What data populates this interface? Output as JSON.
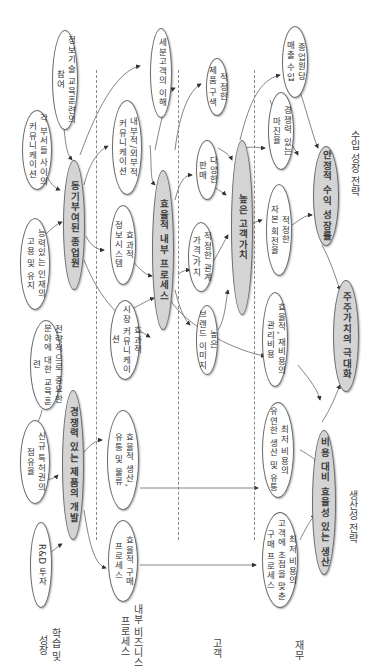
{
  "perspectives": [
    {
      "id": "learning",
      "label": "학습 및\n성장"
    },
    {
      "id": "internal",
      "label": "내부 비즈니스\n프로세스"
    },
    {
      "id": "customer",
      "label": "고객"
    },
    {
      "id": "financial",
      "label": "재무"
    }
  ],
  "strategies": {
    "revenue": "수입 성장 전략",
    "productivity": "생산성 전략"
  },
  "nodes": {
    "it_training": "정보기술 교육훈련의\n참여",
    "dept_comm": "각 부서들 사이의\n커뮤니케이션",
    "retain_talent": "능력있는 인재의\n고용 및 유지",
    "strategic_training": "전략적으로 중요한\n분야에 대한 교육훈련",
    "new_patent": "신규 특허권의\n점유율",
    "rnd": "R&D 투자",
    "motivated_staff": "동기부여된 종업원",
    "competitive_product": "경쟁력 있는 제품의 개발",
    "segment_understanding": "세분고객의 이해",
    "int_ext_comm": "내부적/외부적\n커뮤니케이션",
    "effective_is": "효과적\n정보시스템",
    "market_comm": "효과적\n시장 커뮤니케이션",
    "efficient_internal": "효율적 내부 프로세스",
    "efficient_production": "효율적 생산,\n유통 및 물류",
    "efficient_purchase": "효율적 구매\n프로세스",
    "proper_mix": "적정한\n제품 구색",
    "diverse_sales": "다양한\n판매",
    "price_value": "적정한 관계\n가격/가치",
    "brand_image": "높은\n브랜드 이미지",
    "high_customer_value": "높은 고객가치",
    "revenue_per_employee": "종업원당\n매출 수입",
    "competitive_margin": "경쟁력 있는\n마진율",
    "capital_turnover": "적정한\n자본 회전율",
    "stable_profit": "안정적 수익 성장률",
    "admin_cost": "효율적, 재비용의\n관리비용",
    "shareholder_value": "주주가치의 극대화",
    "low_cost_production": "최저 비용의\n유연한 생산 및 유통",
    "cost_effective_production": "비용 대비 효율성 있는 생산",
    "low_cost_purchase": "최저 비용의\n고객에 초점을 맞춘\n구매 프로세스"
  },
  "colors": {
    "key_node_fill": "#d4d4d4",
    "node_fill": "#ffffff",
    "edge": "#555555",
    "divider": "#888888"
  }
}
